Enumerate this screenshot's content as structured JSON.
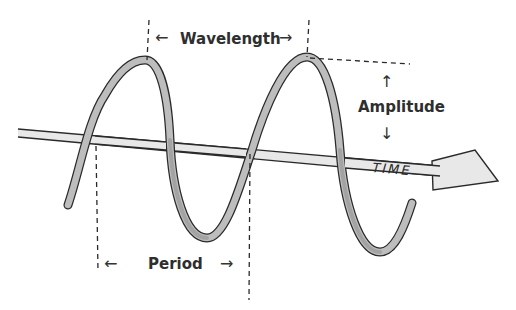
{
  "labels": {
    "wavelength": "Wavelength",
    "amplitude": "Amplitude",
    "period": "Period",
    "time": "TIME"
  },
  "arrows": {
    "left": "←",
    "right": "→",
    "up": "↑",
    "down": "↓"
  },
  "colors": {
    "ribbon_fill": "#bdbdbd",
    "ribbon_dark": "#8f8f8f",
    "outline": "#2a2a2a",
    "axis_fill": "#e6e6e6",
    "text": "#2e2e2e"
  }
}
